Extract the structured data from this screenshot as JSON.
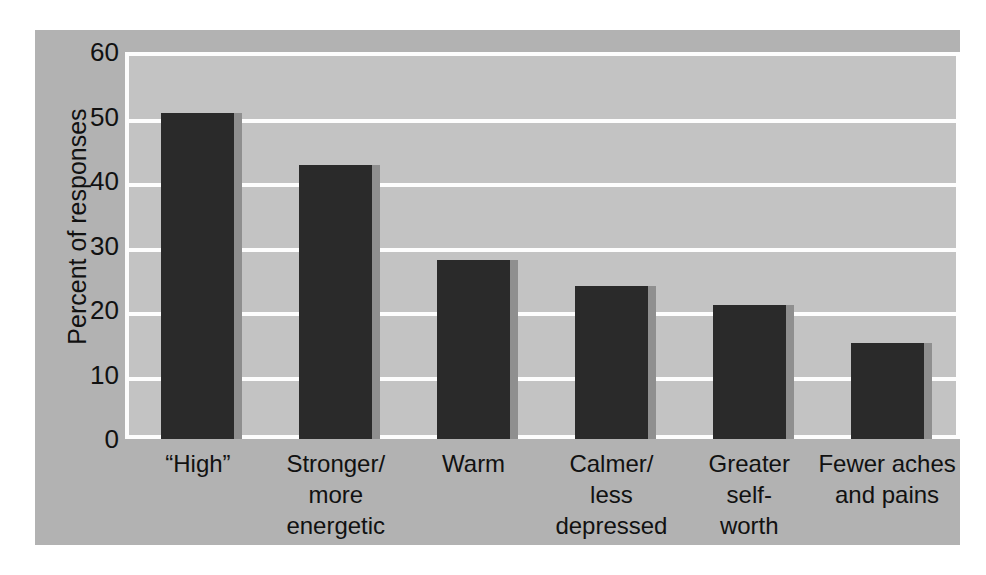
{
  "chart_data": {
    "type": "bar",
    "title": "",
    "subtitle": "",
    "xlabel": "",
    "ylabel": "Percent of responses",
    "categories": [
      "“High”",
      "Stronger/\nmore\nenergetic",
      "Warm",
      "Calmer/\nless\ndepressed",
      "Greater\nself-\nworth",
      "Fewer aches\nand pains"
    ],
    "values": [
      51,
      43,
      28,
      24,
      21,
      15
    ],
    "ylim": [
      0,
      60
    ],
    "yticks": [
      0,
      10,
      20,
      30,
      40,
      50,
      60
    ],
    "ytick_labels": [
      "0",
      "10",
      "20",
      "30",
      "40",
      "50",
      "60"
    ],
    "grid": true,
    "grid_axis": "y",
    "grid_color": "#fdfdfd",
    "legend": false,
    "legend_position": "none",
    "bar_color": "#2a2a2a",
    "bar_shadow_color": "#8f8f8f",
    "plot_background": "#c3c3c3",
    "panel_background": "#b2b2b2",
    "text_color": "#111111"
  }
}
